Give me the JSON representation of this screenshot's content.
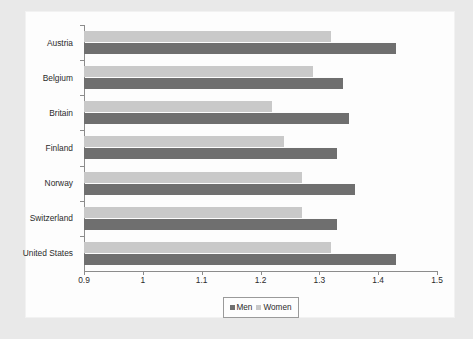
{
  "chart_data": {
    "type": "bar",
    "orientation": "horizontal",
    "title": "",
    "subtitle": "",
    "xlabel": "",
    "ylabel": "",
    "xlim": [
      0.9,
      1.5
    ],
    "xticks": [
      "0.9",
      "1",
      "1.1",
      "1.2",
      "1.3",
      "1.4",
      "1.5"
    ],
    "xtick_values": [
      0.9,
      1.0,
      1.1,
      1.2,
      1.3,
      1.4,
      1.5
    ],
    "grid": false,
    "legend_position": "bottom-center",
    "categories": [
      "Austria",
      "Belgium",
      "Britain",
      "Finland",
      "Norway",
      "Switzerland",
      "United States"
    ],
    "series": [
      {
        "name": "Men",
        "color": "#6f6f6f",
        "values": [
          1.43,
          1.34,
          1.35,
          1.33,
          1.36,
          1.33,
          1.43
        ]
      },
      {
        "name": "Women",
        "color": "#c9c9c9",
        "values": [
          1.32,
          1.29,
          1.22,
          1.24,
          1.27,
          1.27,
          1.32
        ]
      }
    ],
    "annotations": []
  },
  "legend": {
    "entries": [
      {
        "label": "Men",
        "color": "#6f6f6f"
      },
      {
        "label": "Women",
        "color": "#c9c9c9"
      }
    ]
  },
  "colors": {
    "men": "#6f6f6f",
    "women": "#c9c9c9",
    "axis": "#8c8c8c",
    "text": "#2b2b2b",
    "frame": "#e9e9e9",
    "canvas": "#fdfdfd"
  }
}
